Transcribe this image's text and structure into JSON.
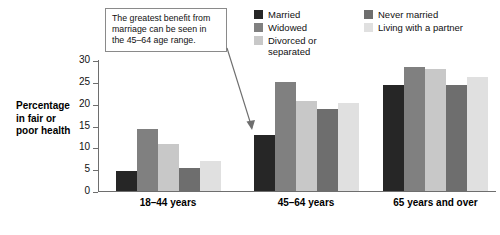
{
  "chart_data": {
    "type": "bar",
    "title": "",
    "xlabel": "",
    "ylabel": "Percentage in fair or poor health",
    "ylim": [
      0,
      30
    ],
    "yticks": [
      0,
      5,
      10,
      15,
      20,
      25,
      30
    ],
    "grid": false,
    "legend_position": "top-right",
    "categories": [
      "18–44 years",
      "45–64 years",
      "65 years and over"
    ],
    "series": [
      {
        "name": "Married",
        "color": "#262626",
        "values": [
          4.6,
          12.9,
          24.2
        ]
      },
      {
        "name": "Widowed",
        "color": "#808080",
        "values": [
          14.2,
          25.0,
          28.3
        ]
      },
      {
        "name": "Divorced or separated",
        "color": "#c8c8c8",
        "values": [
          10.7,
          20.6,
          28.0
        ]
      },
      {
        "name": "Never married",
        "color": "#6e6e6e",
        "values": [
          5.3,
          18.8,
          24.3
        ]
      },
      {
        "name": "Living with a partner",
        "color": "#e0e0e0",
        "values": [
          6.8,
          20.2,
          26.2
        ]
      }
    ],
    "annotations": [
      {
        "text": "The greatest benefit from marriage can be seen in the 45–64 age range.",
        "points_to": "45–64 years / Married"
      }
    ]
  },
  "axis": {
    "y_title_line1": "Percentage",
    "y_title_line2": "in fair or",
    "y_title_line3": "poor health",
    "tick_30": "30",
    "tick_25": "25",
    "tick_20": "20",
    "tick_15": "15",
    "tick_10": "10",
    "tick_5": "5",
    "tick_0": "0"
  },
  "legend": {
    "col_a": [
      {
        "label": "Married",
        "color": "#262626"
      },
      {
        "label": "Widowed",
        "color": "#808080"
      },
      {
        "label": "Divorced or separated",
        "color": "#c8c8c8"
      }
    ],
    "col_b": [
      {
        "label": "Never married",
        "color": "#6e6e6e"
      },
      {
        "label": "Living with a partner",
        "color": "#e0e0e0"
      }
    ]
  },
  "callout": {
    "line1": "The greatest benefit from",
    "line2": "marriage can be seen in",
    "line3": "the 45–64 age range."
  },
  "x_labels": [
    "18–44 years",
    "45–64 years",
    "65 years and over"
  ]
}
